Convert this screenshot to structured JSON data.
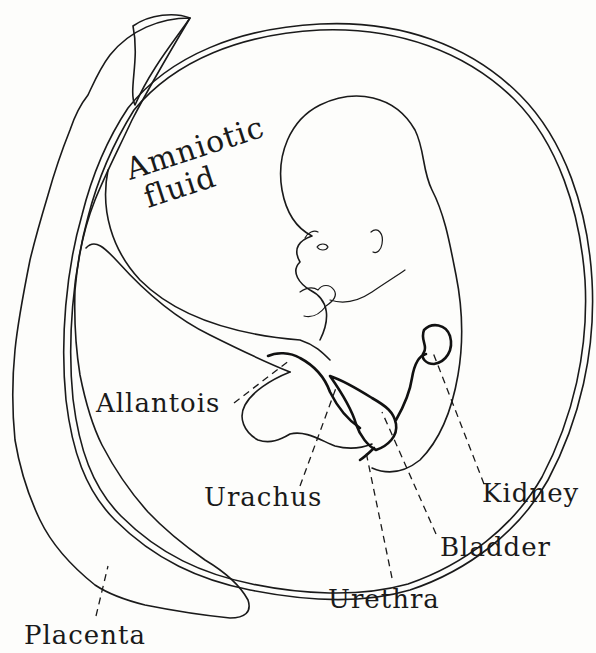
{
  "diagram": {
    "labels": {
      "amniotic_line1": "Amniotic",
      "amniotic_line2": "fluid",
      "allantois": "Allantois",
      "urachus": "Urachus",
      "kidney": "Kidney",
      "bladder": "Bladder",
      "urethra": "Urethra",
      "placenta": "Placenta"
    },
    "colors": {
      "ink": "#1a1a1a",
      "paper": "#fdfdfb"
    }
  }
}
